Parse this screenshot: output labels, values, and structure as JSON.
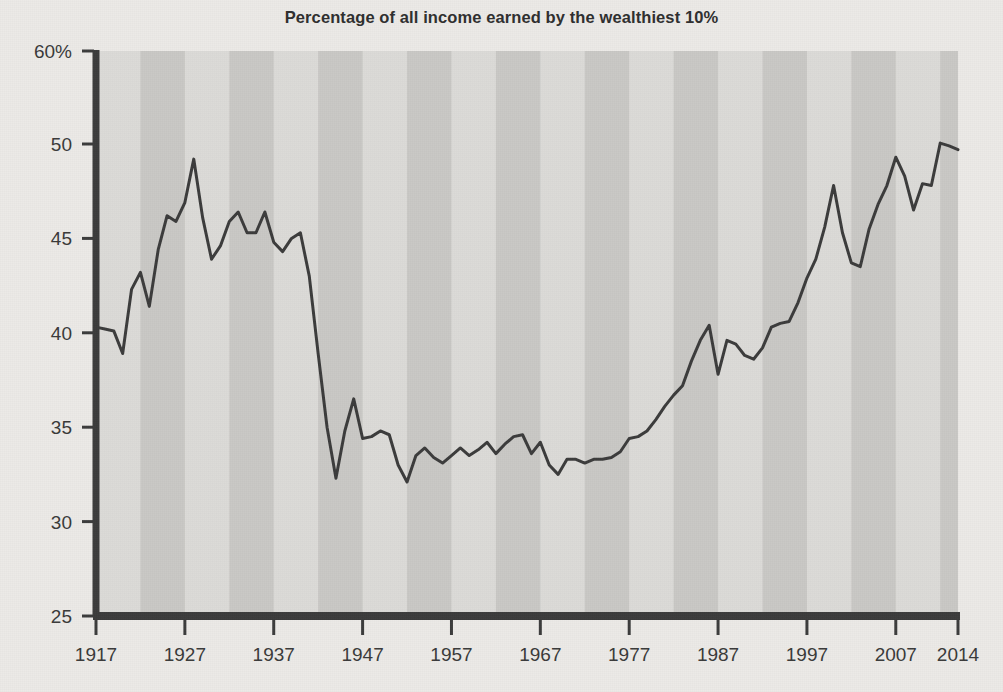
{
  "chart_data": {
    "type": "line",
    "title": "Percentage of all income earned by the wealthiest 10%",
    "subtitle": "",
    "xlabel": "",
    "ylabel": "",
    "grid": false,
    "legend": "none",
    "xlim": [
      1917,
      2014
    ],
    "ylim": [
      25,
      60
    ],
    "y_axis_note": "Axis scale is compressed between 50 and 60",
    "yticks": [
      25,
      30,
      35,
      40,
      45,
      50,
      60
    ],
    "ytick_labels": [
      "25",
      "30",
      "35",
      "40",
      "45",
      "50",
      "60%"
    ],
    "xticks": [
      1917,
      1927,
      1937,
      1947,
      1957,
      1967,
      1977,
      1987,
      1997,
      2007,
      2014
    ],
    "xtick_labels": [
      "1917",
      "1927",
      "1937",
      "1947",
      "1957",
      "1967",
      "1977",
      "1987",
      "1997",
      "2007",
      "2014"
    ],
    "band_colors": [
      "#dcdbd8",
      "#c9c8c5"
    ],
    "band_span_years": 5,
    "line_color": "#3c3c3c",
    "line_width": 3,
    "axis_color": "#3c3c3c",
    "plot_background": "#dcdbd8",
    "series": [
      {
        "name": "Top 10% income share",
        "x": [
          1917,
          1918,
          1919,
          1920,
          1921,
          1922,
          1923,
          1924,
          1925,
          1926,
          1927,
          1928,
          1929,
          1930,
          1931,
          1932,
          1933,
          1934,
          1935,
          1936,
          1937,
          1938,
          1939,
          1940,
          1941,
          1942,
          1943,
          1944,
          1945,
          1946,
          1947,
          1948,
          1949,
          1950,
          1951,
          1952,
          1953,
          1954,
          1955,
          1956,
          1957,
          1958,
          1959,
          1960,
          1961,
          1962,
          1963,
          1964,
          1965,
          1966,
          1967,
          1968,
          1969,
          1970,
          1971,
          1972,
          1973,
          1974,
          1975,
          1976,
          1977,
          1978,
          1979,
          1980,
          1981,
          1982,
          1983,
          1984,
          1985,
          1986,
          1987,
          1988,
          1989,
          1990,
          1991,
          1992,
          1993,
          1994,
          1995,
          1996,
          1997,
          1998,
          1999,
          2000,
          2001,
          2002,
          2003,
          2004,
          2005,
          2006,
          2007,
          2008,
          2009,
          2010,
          2011,
          2012,
          2013,
          2014
        ],
        "y": [
          40.3,
          40.2,
          40.1,
          38.9,
          42.3,
          43.2,
          41.4,
          44.4,
          46.2,
          45.9,
          46.9,
          49.2,
          46.1,
          43.9,
          44.6,
          45.9,
          46.4,
          45.3,
          45.3,
          46.4,
          44.8,
          44.3,
          45.0,
          45.3,
          43.0,
          38.9,
          35.0,
          32.3,
          34.8,
          36.5,
          34.4,
          34.5,
          34.8,
          34.6,
          33.0,
          32.1,
          33.5,
          33.9,
          33.4,
          33.1,
          33.5,
          33.9,
          33.5,
          33.8,
          34.2,
          33.6,
          34.1,
          34.5,
          34.6,
          33.6,
          34.2,
          33.0,
          32.5,
          33.3,
          33.3,
          33.1,
          33.3,
          33.3,
          33.4,
          33.7,
          34.4,
          34.5,
          34.8,
          35.4,
          36.1,
          36.7,
          37.2,
          38.5,
          39.6,
          40.4,
          37.8,
          39.6,
          39.4,
          38.8,
          38.6,
          39.2,
          40.3,
          40.5,
          40.6,
          41.6,
          42.9,
          43.9,
          45.6,
          47.8,
          45.3,
          43.7,
          43.5,
          45.5,
          46.8,
          47.8,
          49.3,
          48.3,
          46.5,
          47.9,
          47.8,
          50.1,
          49.9,
          49.7
        ]
      }
    ]
  },
  "figure": {
    "title_text": "Percentage of all income earned by the wealthiest 10%"
  }
}
